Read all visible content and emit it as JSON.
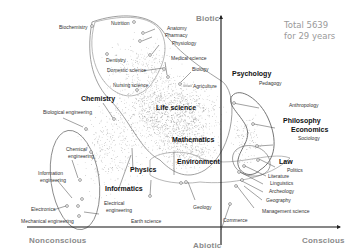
{
  "diagram": {
    "total": {
      "line1": "Total 5639",
      "line2": "for 29 years"
    },
    "axes": {
      "top": "Biotic",
      "bottom": "Abiotic",
      "left": "Nonconscious",
      "right": "Conscious"
    },
    "major_labels": {
      "life_science": "Life science",
      "mathematics": "Mathematics",
      "environment": "Environment",
      "chemistry": "Chemistry",
      "physics": "Physics",
      "informatics": "Informatics",
      "psychology": "Psychology",
      "philosophy": "Philosophy",
      "economics": "Economics",
      "law": "Law"
    },
    "minor_labels": {
      "biochemistry": "Biochemistry",
      "nutrition": "Nutrition",
      "anatomy": "Anatomy",
      "pharmacy": "Pharmacy",
      "physiology": "Physiology",
      "dentistry": "Dentistry",
      "medical_science": "Medical science",
      "domestic_science": "Domestic science",
      "biology": "Biology",
      "nursing_science": "Nursing science",
      "agriculture": "Agriculture",
      "biological_engineering": "Biological engineering",
      "chemical_engineering_1": "Chemical",
      "chemical_engineering_2": "engineering",
      "information_engineering_1": "Information",
      "information_engineering_2": "engineering",
      "electronics": "Electronics",
      "electrical_engineering_1": "Electrical",
      "electrical_engineering_2": "engineering",
      "mechanical_engineering": "Mechanical engineering",
      "earth_science": "Earth science",
      "geology": "Geology",
      "commerce": "Commerce",
      "pedagogy": "Pedagogy",
      "anthropology": "Anthropology",
      "sociology": "Sociology",
      "politics": "Politics",
      "literature": "Literature",
      "linguistics": "Linguistics",
      "archeology": "Archeology",
      "geography": "Geography",
      "management_science": "Management science"
    }
  }
}
